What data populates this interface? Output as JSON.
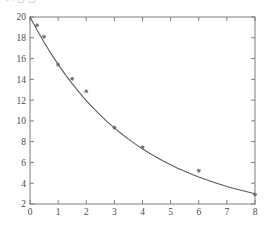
{
  "header": {
    "fragment_text": "· · ▭ ▭"
  },
  "chart_data": {
    "type": "scatter",
    "title": "",
    "subtitle": "",
    "xlabel": "",
    "ylabel": "",
    "xlim": [
      0,
      8
    ],
    "ylim": [
      2,
      20
    ],
    "grid": false,
    "legend": null,
    "legend_position": "none",
    "x_ticks": [
      0,
      1,
      2,
      3,
      4,
      5,
      6,
      7,
      8
    ],
    "x_tick_labels": [
      "0",
      "1",
      "2",
      "3",
      "4",
      "5",
      "6",
      "7",
      "8"
    ],
    "y_ticks": [
      2,
      4,
      6,
      8,
      10,
      12,
      14,
      16,
      18,
      20
    ],
    "y_tick_labels": [
      "2",
      "4",
      "6",
      "8",
      "10",
      "12",
      "14",
      "16",
      "18",
      "20"
    ],
    "series": [
      {
        "name": "data points",
        "kind": "scatter",
        "marker": "star",
        "color": "#6a6a6a",
        "x": [
          0.25,
          0.5,
          1.0,
          1.5,
          2.0,
          3.0,
          4.0,
          6.0,
          8.0
        ],
        "values": [
          19.2,
          18.1,
          15.4,
          14.05,
          12.85,
          9.35,
          7.45,
          5.2,
          2.9
        ]
      },
      {
        "name": "fitted decay curve",
        "kind": "line",
        "color": "#5c5c5c",
        "model": "exponential decay",
        "x": [
          0,
          0.25,
          0.5,
          0.75,
          1.0,
          1.25,
          1.5,
          1.75,
          2.0,
          2.25,
          2.5,
          2.75,
          3.0,
          3.25,
          3.5,
          3.75,
          4.0,
          4.25,
          4.5,
          4.75,
          5.0,
          5.25,
          5.5,
          5.75,
          6.0,
          6.25,
          6.5,
          6.75,
          7.0,
          7.25,
          7.5,
          7.75,
          8.0
        ],
        "values": [
          20.0,
          18.74,
          17.57,
          16.47,
          15.44,
          14.48,
          13.58,
          12.74,
          11.96,
          11.23,
          10.55,
          9.91,
          9.32,
          8.76,
          8.24,
          7.76,
          7.31,
          6.89,
          6.49,
          6.12,
          5.78,
          5.45,
          5.15,
          4.87,
          4.6,
          4.35,
          4.12,
          3.9,
          3.69,
          3.5,
          3.32,
          3.15,
          2.99
        ]
      }
    ]
  }
}
